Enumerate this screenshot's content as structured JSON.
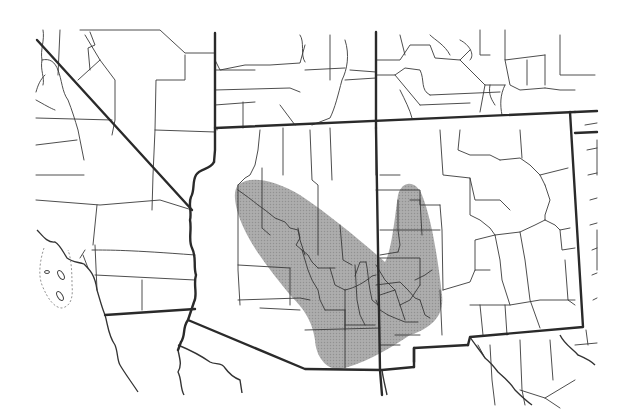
{
  "map": {
    "type": "species-range-map",
    "region": "Southwestern United States (Arizona / New Mexico)",
    "width": 629,
    "height": 418,
    "colors": {
      "background": "#ffffff",
      "range_fill": "#9a9a9a",
      "range_opacity": "0.85",
      "line": "#2a2a2a"
    },
    "range_polygon": "M 238 185 C 250 175 275 180 300 195 C 330 215 360 240 385 262 C 392 250 395 215 398 195 C 402 180 416 180 422 195 C 432 220 438 260 442 295 C 445 320 425 330 410 335 C 395 345 372 360 345 368 C 328 373 316 358 315 340 C 312 318 300 305 290 295 C 270 270 245 240 237 210 C 234 198 234 190 238 185 Z",
    "state_lines": [
      "M 37 40 L 192 210",
      "M 215 33 L 215 150 L 214 162",
      "M 215 128 L 575 112",
      "M 376 32 L 376 128",
      "M 376 128 L 380 370 L 382 395",
      "M 570 112 L 583 327 L 470 337 L 468 345",
      "M 575 112 L 597 111",
      "M 575 133 L 597 132",
      "M 105 315 L 195 309",
      "M 188 320 L 305 369 L 382 370 L 414 367",
      "M 414 362 L 414 348 L 468 345",
      "M 414 348 L 414 367"
    ],
    "colorado_river": "M 214 162 C 210 170 200 168 196 175 C 192 182 195 190 191 197 C 188 204 192 212 190 220 C 192 230 188 240 192 248 C 197 258 193 266 196 275 C 193 285 198 295 194 302 L 188 320 C 182 328 186 335 181 342 L 178 350",
    "coast_lines": [
      "M 37 230 C 42 235 47 243 55 242 C 60 245 62 250 67 258 C 72 262 78 262 84 264 C 90 270 95 275 97 290 C 100 300 102 308 105 315 C 108 325 108 335 115 345 C 118 352 117 360 120 365 C 124 372 130 380 138 392"
    ],
    "rivers": [
      "M 178 350 C 180 360 182 365 178 372 C 182 380 180 388 184 395",
      "M 178 345 C 190 350 200 355 210 362 C 215 365 222 362 225 368 C 230 375 235 378 240 380 L 242 393",
      "M 470 337 C 475 345 480 350 485 358 C 490 362 495 368 498 372 C 505 378 510 382 515 390 C 520 395 525 400 532 405",
      "M 382 370 C 383 378 385 385 387 395",
      "M 560 335 C 565 345 572 348 578 355 C 585 358 590 360 595 365"
    ],
    "county_lines": [
      "M 43 30 C 45 40 40 50 42 60 C 40 70 45 78 43 85",
      "M 42 60 C 50 58 55 62 58 70",
      "M 45 75 C 40 80 38 85 36 92",
      "M 58 70 C 62 80 62 92 68 100 C 72 110 75 120 78 130 C 80 140 82 150 84 160",
      "M 36 100 C 45 105 50 108 55 110",
      "M 58 75 L 60 30",
      "M 90 32 L 95 45 L 88 48 L 90 70",
      "M 80 30 L 160 30 L 185 53 L 215 53",
      "M 85 35 L 100 60 L 115 80 L 115 120 L 112 135",
      "M 100 60 L 78 80",
      "M 185 55 L 185 80 L 156 80 L 155 130 L 153 175 L 152 210",
      "M 155 130 L 215 132",
      "M 36 118 L 112 120",
      "M 36 145 L 77 140",
      "M 36 175 L 84 175",
      "M 36 200 L 100 205 L 160 200 L 192 210",
      "M 97 205 L 93 245",
      "M 95 245 L 97 290",
      "M 92 250 C 110 250 130 250 195 255",
      "M 95 275 L 195 280",
      "M 142 280 L 142 310",
      "M 85 250 L 80 258",
      "M 83 255 L 88 268",
      "M 215 60 L 220 70 L 245 65 L 270 65 L 300 63 L 305 45",
      "M 215 70 L 255 70",
      "M 215 90 L 290 88 L 300 92",
      "M 215 105 L 255 102",
      "M 243 102 L 243 128",
      "M 280 105 C 285 112 290 118 295 125",
      "M 300 35 C 305 42 300 55 305 62",
      "M 305 70 L 345 68",
      "M 330 35 L 330 80",
      "M 345 40 C 350 55 347 70 342 80 C 338 95 335 108 330 118 L 312 125",
      "M 345 80 L 376 78",
      "M 350 70 L 376 72",
      "M 376 60 L 400 60 L 410 45 L 430 45 L 435 58 L 460 60 L 470 50",
      "M 376 75 L 395 75 L 405 68 L 420 70 C 425 80 420 90 430 95",
      "M 405 55 L 400 35",
      "M 430 35 C 435 40 445 45 450 55",
      "M 460 60 L 475 75 L 485 85 L 505 85",
      "M 395 75 L 420 105",
      "M 460 40 C 470 45 475 55 470 60",
      "M 480 30 L 480 55 L 490 55",
      "M 505 30 L 505 60 L 545 55",
      "M 560 35 L 560 75 L 595 75",
      "M 505 60 L 510 85 L 520 90 L 545 88",
      "M 545 55 L 545 85",
      "M 527 60 L 527 85",
      "M 505 85 C 500 95 500 105 502 115",
      "M 490 85 C 488 95 492 100 495 105",
      "M 485 85 L 480 112",
      "M 400 90 C 405 100 410 110 412 118",
      "M 420 105 L 470 103",
      "M 430 95 L 500 92",
      "M 545 88 L 560 90 L 575 90",
      "M 217 128 L 217 130",
      "M 260 130 L 258 150 L 255 165 L 250 175 L 245 178 L 238 185",
      "M 238 185 L 238 270 L 240 305",
      "M 238 265 L 290 268",
      "M 283 128 L 283 175",
      "M 310 130 L 312 180 L 318 185 L 318 255",
      "M 330 128 L 332 180",
      "M 238 300 L 300 298 L 310 300",
      "M 260 308 L 300 310",
      "M 290 268 L 290 305",
      "M 305 330 L 380 328",
      "M 345 310 L 345 368",
      "M 380 175 L 400 175",
      "M 376 175 L 376 128",
      "M 376 190 L 420 190 L 420 205 L 440 205",
      "M 380 230 L 440 230",
      "M 380 258 L 420 258 L 420 285",
      "M 376 265 L 385 280 L 395 290 L 400 305",
      "M 440 130 L 443 175 L 470 178 L 475 200 L 500 200 L 510 210",
      "M 440 205 L 442 230 L 443 290",
      "M 470 178 L 470 215 L 480 220 L 490 228 L 495 235",
      "M 500 160 L 520 158 L 530 165 L 540 175 L 545 185",
      "M 520 130 L 522 158",
      "M 460 130 L 458 150 L 470 155 L 490 155 L 500 160",
      "M 400 305 L 410 300 L 420 285",
      "M 443 290 L 470 282 L 475 270 L 490 270",
      "M 475 270 L 475 240 L 495 235 L 520 232 L 535 225 L 545 220",
      "M 545 185 L 550 200 L 545 215 L 545 220",
      "M 540 175 L 560 170 L 568 168",
      "M 545 220 L 555 225 L 560 230 L 570 228",
      "M 495 235 L 500 260 L 502 280 L 510 305",
      "M 520 232 L 525 260 L 530 300 L 540 328",
      "M 560 230 L 562 250 L 575 248",
      "M 565 260 L 568 300 L 575 305",
      "M 470 305 L 510 305 L 540 300 L 575 300",
      "M 380 295 L 395 290",
      "M 400 305 L 405 320",
      "M 380 345 L 400 345",
      "M 440 290 L 442 335",
      "M 395 335 L 420 335",
      "M 480 305 L 483 335",
      "M 505 305 L 507 335",
      "M 478 345 L 485 358",
      "M 490 345 L 492 380 L 495 405",
      "M 520 340 L 522 390 L 525 405",
      "M 520 390 L 545 398 L 560 408",
      "M 545 398 L 575 380",
      "M 550 340 L 553 380",
      "M 585 125 L 597 123",
      "M 587 150 L 597 148",
      "M 588 175 L 597 173",
      "M 590 200 L 597 198",
      "M 590 225 L 597 223",
      "M 592 250 L 597 248",
      "M 592 275 L 597 273",
      "M 593 300 L 597 298",
      "M 597 140 L 597 175",
      "M 597 230 L 597 270",
      "M 586 330 L 588 345",
      "M 575 345 L 597 343",
      "M 262 168 L 262 228 L 270 235",
      "M 238 190 C 245 195 252 200 258 205 L 265 210 L 275 218 L 285 222 L 290 228 L 298 230 L 300 240 L 305 255",
      "M 298 228 L 300 238 L 296 245 L 302 250 L 308 255 L 312 262 L 318 268",
      "M 302 250 L 305 260 L 308 270 L 312 280 L 318 290 L 320 300 L 325 310",
      "M 340 225 L 343 260 L 352 265",
      "M 330 268 L 335 285 L 345 290",
      "M 318 268 L 335 268",
      "M 345 290 C 355 288 365 282 372 276 L 376 275",
      "M 355 265 L 357 300 L 360 315 L 365 325",
      "M 345 290 L 345 330",
      "M 325 310 L 345 310",
      "M 345 325 L 375 325",
      "M 366 262 C 368 270 368 280 370 290 L 372 300 L 378 305",
      "M 355 276 L 360 262 L 366 262",
      "M 380 255 L 398 252",
      "M 376 285 L 400 282 L 408 290 L 415 298 L 420 300",
      "M 376 300 L 380 310 L 388 315",
      "M 388 315 L 395 318 L 405 322 L 418 322",
      "M 398 200 L 398 230 L 400 245 L 398 252",
      "M 410 200 L 420 200",
      "M 420 200 L 422 235",
      "M 415 280 L 425 275 L 432 270",
      "M 420 300 L 425 315 L 430 318"
    ],
    "islands": [
      {
        "cx": 47,
        "cy": 272,
        "rx": 2.5,
        "ry": 1.5
      },
      {
        "cx": 61,
        "cy": 275,
        "rx": 2.5,
        "ry": 5,
        "rot": -30
      },
      {
        "cx": 60,
        "cy": 296,
        "rx": 2.5,
        "ry": 5,
        "rot": -30
      }
    ],
    "island_boundary": "M 44 248 C 40 260 38 275 42 285 C 48 300 55 308 62 308 C 72 306 73 295 72 285 C 72 270 71 258 68 250"
  }
}
